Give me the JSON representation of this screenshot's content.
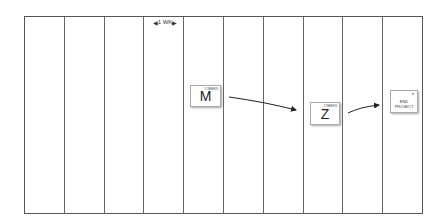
{
  "diagram": {
    "type": "timeline-grid",
    "columns": 10,
    "scale_label": "1 WK",
    "notes": [
      {
        "id": "m",
        "label": "M",
        "duration": "2 WEEKS"
      },
      {
        "id": "z",
        "label": "Z",
        "duration": "2 WEEKS"
      },
      {
        "id": "end",
        "label": "END PROJECT",
        "marker": "*"
      }
    ],
    "arrows": [
      {
        "from": "m",
        "to": "z"
      },
      {
        "from": "z",
        "to": "end"
      }
    ]
  }
}
